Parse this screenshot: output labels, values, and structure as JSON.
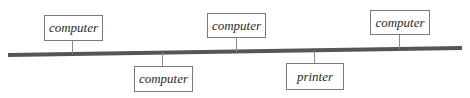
{
  "diagram": {
    "type": "bus-network-topology",
    "bus": {
      "x1": 8,
      "y1": 55,
      "x2": 462,
      "y2": 48,
      "color": "#555555",
      "width": 4
    },
    "nodes": [
      {
        "id": "n1",
        "label": "computer",
        "side": "top",
        "x": 44,
        "y": 15,
        "w": 58,
        "h": 25,
        "stem_x": 72
      },
      {
        "id": "n2",
        "label": "computer",
        "side": "bottom",
        "x": 134,
        "y": 66,
        "w": 58,
        "h": 25,
        "stem_x": 162
      },
      {
        "id": "n3",
        "label": "computer",
        "side": "top",
        "x": 207,
        "y": 13,
        "w": 58,
        "h": 24,
        "stem_x": 236
      },
      {
        "id": "n4",
        "label": "printer",
        "side": "bottom",
        "x": 286,
        "y": 63,
        "w": 57,
        "h": 26,
        "stem_x": 314
      },
      {
        "id": "n5",
        "label": "computer",
        "side": "top",
        "x": 370,
        "y": 10,
        "w": 59,
        "h": 24,
        "stem_x": 399
      }
    ]
  }
}
